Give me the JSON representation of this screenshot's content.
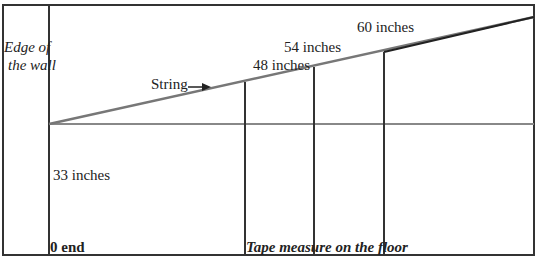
{
  "diagram": {
    "labels": {
      "wall": [
        "Edge of",
        "the wall"
      ],
      "string": "String",
      "m48": "48 inches",
      "m54": "54 inches",
      "m60": "60 inches",
      "m33": "33 inches",
      "zero_end": "0 end",
      "tape": "Tape measure on the floor"
    },
    "colors": {
      "frame": "#333333",
      "string": "#777777",
      "floor": "#888888",
      "verticals": "#333333",
      "text": "#222222"
    }
  }
}
